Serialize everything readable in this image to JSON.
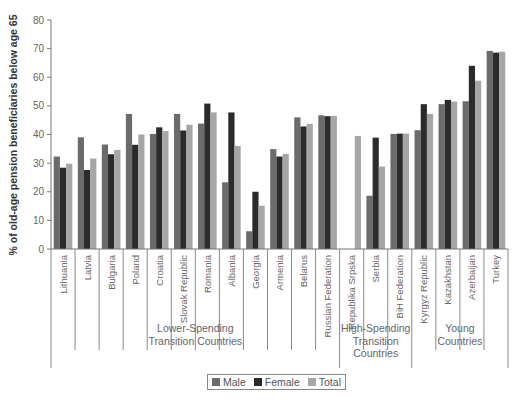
{
  "header_fragment": "",
  "chart_data": {
    "type": "bar",
    "title": "",
    "xlabel": "",
    "ylabel": "% of old-age pension beneficiaries below age 65",
    "ylim": [
      0,
      80
    ],
    "yticks": [
      0,
      10,
      20,
      30,
      40,
      50,
      60,
      70,
      80
    ],
    "grid": false,
    "legend_position": "bottom",
    "categories": [
      "Lithuania",
      "Latvia",
      "Bulgaria",
      "Poland",
      "Croatia",
      "Slovak Republic",
      "Romania",
      "Albania",
      "Georgia",
      "Armenia",
      "Belarus",
      "Russian Federation",
      "Republika Srpska",
      "Serbia",
      "BiH Federation",
      "Kyrgyz Republic",
      "Kazakhstan",
      "Azerbaijan",
      "Turkey"
    ],
    "groups": [
      {
        "label_lines": [
          "Lower-Spending",
          "Transition Countries"
        ],
        "start": 0,
        "end": 11
      },
      {
        "label_lines": [
          "High-Spending",
          "Transition",
          "Countries"
        ],
        "start": 12,
        "end": 14
      },
      {
        "label_lines": [
          "Young",
          "Countries"
        ],
        "start": 15,
        "end": 18
      }
    ],
    "series": [
      {
        "name": "Male",
        "color": "#6b6b6b",
        "values": [
          32.3,
          39.0,
          36.5,
          47.2,
          40.2,
          47.2,
          43.8,
          23.3,
          6.2,
          34.9,
          46.0,
          46.7,
          null,
          18.6,
          40.2,
          41.5,
          50.6,
          51.6,
          69.2
        ]
      },
      {
        "name": "Female",
        "color": "#2b2b2b",
        "values": [
          28.4,
          27.6,
          33.1,
          36.4,
          42.5,
          41.4,
          50.8,
          47.7,
          20.0,
          32.3,
          42.8,
          46.4,
          null,
          38.9,
          40.3,
          50.6,
          52.1,
          64.0,
          68.6
        ]
      },
      {
        "name": "Total",
        "color": "#a6a6a6",
        "values": [
          29.8,
          31.6,
          34.6,
          40.0,
          41.2,
          43.4,
          47.7,
          36.0,
          15.1,
          33.2,
          43.7,
          46.5,
          39.5,
          28.8,
          40.3,
          47.2,
          51.5,
          58.8,
          68.9
        ]
      }
    ]
  },
  "legend": {
    "items": [
      {
        "label": "Male",
        "color": "#6b6b6b"
      },
      {
        "label": "Female",
        "color": "#2b2b2b"
      },
      {
        "label": "Total",
        "color": "#a6a6a6"
      }
    ]
  }
}
